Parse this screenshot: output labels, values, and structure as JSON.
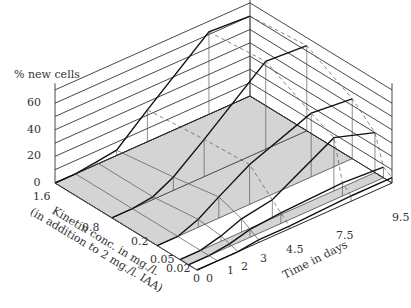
{
  "chart_data": {
    "type": "3d-surface-line",
    "title": "",
    "zlabel": "% new cells",
    "xlabel": "Kinetin conc. in mg./l.",
    "xlabel_sub": "(in addition to 2 mg./l. IAA)",
    "ylabel": "Time in days",
    "z_ticks": [
      "0",
      "20",
      "40",
      "60"
    ],
    "zlim": [
      0,
      75
    ],
    "kinetin_ticks": [
      "1.6",
      "0.8",
      "0.2",
      "0.05",
      "0.02",
      "0"
    ],
    "time_ticks": [
      "0",
      "1",
      "2",
      "3",
      "4.5",
      "7.5",
      "9.5"
    ],
    "categories_kinetin": [
      0,
      0.02,
      0.05,
      0.2,
      0.8,
      1.6
    ],
    "categories_time": [
      0,
      1,
      2,
      3,
      4.5,
      7.5,
      9.5
    ],
    "series": [
      {
        "name": "kinetin 1.6",
        "values": [
          0,
          0,
          2,
          4,
          24,
          62,
          60
        ]
      },
      {
        "name": "kinetin 0.8",
        "values": [
          0,
          0,
          2,
          10,
          28,
          66,
          64
        ]
      },
      {
        "name": "kinetin 0.2",
        "values": [
          0,
          0,
          6,
          16,
          30,
          48,
          45
        ]
      },
      {
        "name": "kinetin 0.05",
        "values": [
          0,
          0,
          4,
          10,
          14,
          40,
          30
        ]
      },
      {
        "name": "kinetin 0.02",
        "values": [
          0,
          0,
          2,
          6,
          8,
          10,
          8
        ]
      },
      {
        "name": "kinetin 0",
        "values": [
          0,
          0,
          0,
          2,
          2,
          4,
          4
        ]
      }
    ],
    "grid": true,
    "legend": "none"
  },
  "labels": {
    "zlabel": "% new cells",
    "xlabel": "Kinetin conc. in mg./l.",
    "xlabel_sub": "(in addition to 2 mg./l. IAA)",
    "ylabel": "Time in days"
  }
}
